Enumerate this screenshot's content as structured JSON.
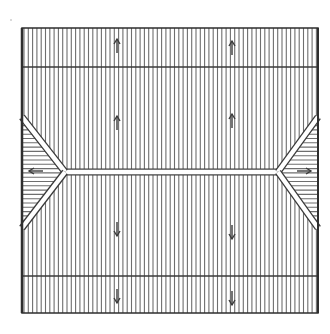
{
  "diagram": {
    "type": "hip-roof-plan",
    "colors": {
      "background": "#ffffff",
      "ink": "#3a3a3a",
      "hatch": "#6e6e6e",
      "frame": "#2e2e2e"
    },
    "frame": {
      "x1": 22,
      "y1": 28,
      "x2": 318,
      "y2": 313
    },
    "hatch_spacing_vertical": 4.3,
    "hatch_spacing_horizontal": 4.3,
    "eave_lines_y": [
      67,
      276
    ],
    "ridge": {
      "x1": 65,
      "x2": 278,
      "y": 172,
      "half_width": 3
    },
    "hips": {
      "left": {
        "apex": [
          65,
          172
        ],
        "top": [
          22,
          117
        ],
        "bottom": [
          22,
          228
        ]
      },
      "right": {
        "apex": [
          278,
          172
        ],
        "top": [
          318,
          117
        ],
        "bottom": [
          318,
          228
        ]
      }
    },
    "slope_arrows": [
      {
        "x": 117,
        "y": 45,
        "dir": "up",
        "region": "north-eave"
      },
      {
        "x": 232,
        "y": 47,
        "dir": "up",
        "region": "north-eave"
      },
      {
        "x": 117,
        "y": 122,
        "dir": "up",
        "region": "north-slope"
      },
      {
        "x": 232,
        "y": 120,
        "dir": "up",
        "region": "north-slope"
      },
      {
        "x": 117,
        "y": 230,
        "dir": "down",
        "region": "south-slope"
      },
      {
        "x": 232,
        "y": 233,
        "dir": "down",
        "region": "south-slope"
      },
      {
        "x": 117,
        "y": 297,
        "dir": "down",
        "region": "south-eave"
      },
      {
        "x": 232,
        "y": 299,
        "dir": "down",
        "region": "south-eave"
      },
      {
        "x": 35,
        "y": 171,
        "dir": "left",
        "region": "west-hip"
      },
      {
        "x": 305,
        "y": 171,
        "dir": "right",
        "region": "east-hip"
      }
    ],
    "stray_mark": {
      "x": 11,
      "y": 20
    }
  }
}
